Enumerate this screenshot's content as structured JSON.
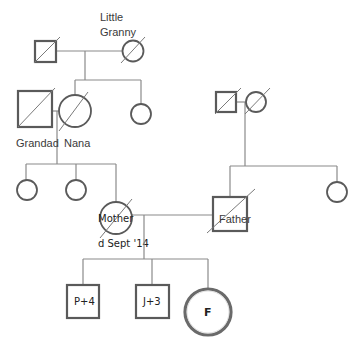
{
  "diagram": {
    "type": "genogram",
    "colors": {
      "line": "#8a8a8a",
      "shape_stroke": "#5a5a5a",
      "background": "#ffffff"
    },
    "labels": {
      "little_granny_line1": "Little",
      "little_granny_line2": "Granny",
      "grandad": "Grandad",
      "nana": "Nana",
      "mother": "Mother",
      "mother_death": "d Sept '14",
      "father": "Father",
      "child1": "P+4",
      "child2": "J+3",
      "child3": "F"
    },
    "people": [
      {
        "id": "great-grandfather",
        "sex": "male",
        "deceased": true
      },
      {
        "id": "little-granny",
        "sex": "female",
        "deceased": true,
        "label": "Little Granny"
      },
      {
        "id": "grandad",
        "sex": "male",
        "deceased": true,
        "label": "Grandad"
      },
      {
        "id": "nana",
        "sex": "female",
        "deceased": true,
        "label": "Nana"
      },
      {
        "id": "great-aunt",
        "sex": "female",
        "deceased": false
      },
      {
        "id": "paternal-grandfather",
        "sex": "male",
        "deceased": true
      },
      {
        "id": "paternal-grandmother",
        "sex": "female",
        "deceased": true
      },
      {
        "id": "maternal-aunt-1",
        "sex": "female",
        "deceased": false
      },
      {
        "id": "maternal-aunt-2",
        "sex": "female",
        "deceased": false
      },
      {
        "id": "mother",
        "sex": "female",
        "deceased": true,
        "label": "Mother",
        "note": "d Sept '14"
      },
      {
        "id": "father",
        "sex": "male",
        "deceased": true,
        "label": "Father"
      },
      {
        "id": "paternal-aunt",
        "sex": "female",
        "deceased": false
      },
      {
        "id": "child-p",
        "sex": "male",
        "label": "P+4"
      },
      {
        "id": "child-j",
        "sex": "male",
        "label": "J+3"
      },
      {
        "id": "child-f",
        "sex": "female",
        "label": "F",
        "index_person": true
      }
    ]
  }
}
